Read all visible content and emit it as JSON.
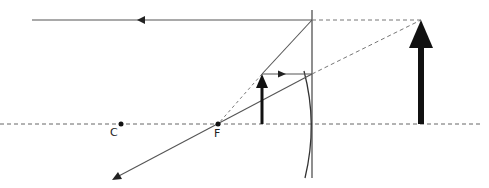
{
  "diagram": {
    "type": "optics-ray-diagram",
    "labels": {
      "center_of_curvature": "C",
      "focal_point": "F"
    },
    "colors": {
      "line": "#444444",
      "arrow_fill": "#111111",
      "dashed": "#666666",
      "background": "#ffffff"
    },
    "elements": {
      "principal_axis": {
        "y": 124,
        "x_start": 0,
        "x_end": 482,
        "style": "dashed"
      },
      "mirror_vertical_line": {
        "x": 312,
        "y_top": 10,
        "y_bottom": 178
      },
      "mirror_curve": {
        "top": [
          304,
          71
        ],
        "middle": [
          312,
          124
        ],
        "bottom": [
          305,
          178
        ]
      },
      "point_C": {
        "x": 121,
        "y": 124
      },
      "point_F": {
        "x": 218,
        "y": 124
      },
      "object_arrow": {
        "x": 262,
        "base_y": 124,
        "tip_y": 74
      },
      "image_arrow": {
        "x": 421,
        "base_y": 124,
        "tip_y": 20
      }
    }
  }
}
